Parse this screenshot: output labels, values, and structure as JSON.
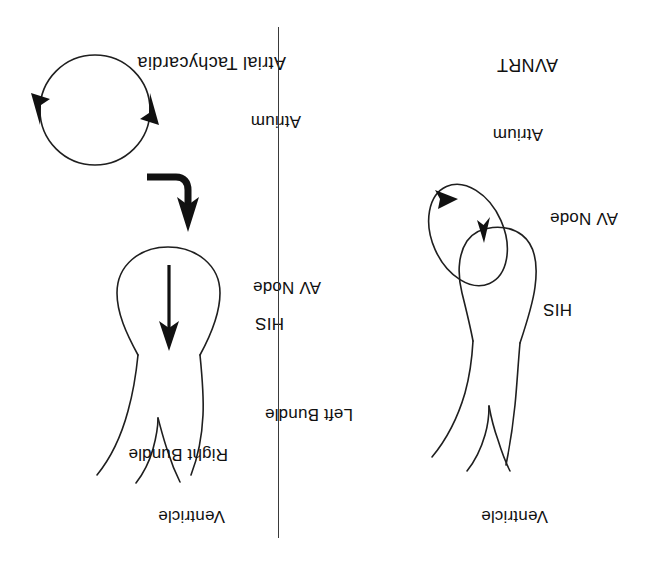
{
  "figure": {
    "orientation": "rotated-180",
    "background_color": "#ffffff",
    "ink_color": "#1a1a1a",
    "divider_color": "#3a3a3a"
  },
  "panels": [
    {
      "id": "avnrt",
      "title": "AVNRT",
      "labels": {
        "ventricle": "Ventricle",
        "his": "HIS",
        "av_node": "AV Node",
        "atrium": "Atrium"
      },
      "circuit_description": "reentry loop at AV node"
    },
    {
      "id": "atrial-tachycardia",
      "title": "Atrial Tachycardia",
      "labels": {
        "ventricle": "Ventricle",
        "right_bundle": "Right Bundle",
        "left_bundle": "Left Bundle",
        "his": "HIS",
        "av_node": "AV Node",
        "atrium": "Atrium"
      },
      "circuit_description": "circular atrial focus with conduction arrow into AV node"
    }
  ]
}
